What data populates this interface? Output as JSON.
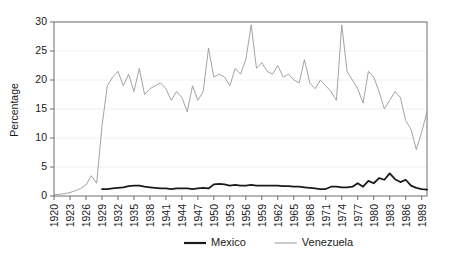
{
  "chart_data": {
    "type": "line",
    "title": "",
    "xlabel": "",
    "ylabel": "Percentage",
    "ylim": [
      0,
      30
    ],
    "xlim": [
      1920,
      1990
    ],
    "yticks": [
      0,
      5,
      10,
      15,
      20,
      25,
      30
    ],
    "ytick_labels": [
      "0",
      "5",
      "10",
      "15",
      "20",
      "25",
      "30"
    ],
    "xticks": [
      1920,
      1923,
      1926,
      1929,
      1932,
      1935,
      1938,
      1941,
      1944,
      1947,
      1950,
      1953,
      1956,
      1959,
      1962,
      1965,
      1968,
      1971,
      1974,
      1977,
      1980,
      1983,
      1986,
      1989
    ],
    "xtick_labels": [
      "1920",
      "1923",
      "1926",
      "1929",
      "1932",
      "1935",
      "1938",
      "1941",
      "1944",
      "1947",
      "1950",
      "1953",
      "1956",
      "1959",
      "1962",
      "1965",
      "1968",
      "1971",
      "1974",
      "1977",
      "1980",
      "1983",
      "1986",
      "1989"
    ],
    "grid": true,
    "legend_position": "below",
    "x": [
      1920,
      1921,
      1922,
      1923,
      1924,
      1925,
      1926,
      1927,
      1928,
      1929,
      1930,
      1931,
      1932,
      1933,
      1934,
      1935,
      1936,
      1937,
      1938,
      1939,
      1940,
      1941,
      1942,
      1943,
      1944,
      1945,
      1946,
      1947,
      1948,
      1949,
      1950,
      1951,
      1952,
      1953,
      1954,
      1955,
      1956,
      1957,
      1958,
      1959,
      1960,
      1961,
      1962,
      1963,
      1964,
      1965,
      1966,
      1967,
      1968,
      1969,
      1970,
      1971,
      1972,
      1973,
      1974,
      1975,
      1976,
      1977,
      1978,
      1979,
      1980,
      1981,
      1982,
      1983,
      1984,
      1985,
      1986,
      1987,
      1988,
      1989,
      1990
    ],
    "series": [
      {
        "name": "Mexico",
        "color": "#1a1a1a",
        "linewidth": 1.8,
        "values": [
          null,
          null,
          null,
          null,
          null,
          null,
          null,
          null,
          null,
          1.2,
          1.2,
          1.3,
          1.4,
          1.5,
          1.7,
          1.8,
          1.8,
          1.6,
          1.5,
          1.4,
          1.3,
          1.3,
          1.2,
          1.3,
          1.3,
          1.3,
          1.2,
          1.3,
          1.4,
          1.3,
          2.0,
          2.1,
          2.0,
          1.8,
          1.9,
          1.8,
          1.8,
          1.9,
          1.8,
          1.8,
          1.8,
          1.8,
          1.8,
          1.7,
          1.7,
          1.6,
          1.6,
          1.5,
          1.4,
          1.3,
          1.2,
          1.2,
          1.6,
          1.6,
          1.5,
          1.5,
          1.6,
          2.2,
          1.6,
          2.6,
          2.2,
          3.1,
          2.8,
          3.9,
          2.9,
          2.4,
          2.8,
          1.8,
          1.4,
          1.2,
          1.1
        ]
      },
      {
        "name": "Venezuela",
        "color": "#999999",
        "linewidth": 0.9,
        "values": [
          0.2,
          0.3,
          0.4,
          0.6,
          0.9,
          1.3,
          1.9,
          3.5,
          2.2,
          12.0,
          19.0,
          20.5,
          21.5,
          19.0,
          21.0,
          18.0,
          22.0,
          17.5,
          18.5,
          19.0,
          19.5,
          18.5,
          16.5,
          18.0,
          17.0,
          14.5,
          19.0,
          16.5,
          18.0,
          25.5,
          20.5,
          21.0,
          20.5,
          19.0,
          22.0,
          21.0,
          23.5,
          29.5,
          22.0,
          23.0,
          21.5,
          21.0,
          22.5,
          20.5,
          21.0,
          20.0,
          19.5,
          23.5,
          19.5,
          18.5,
          20.0,
          19.0,
          18.0,
          16.5,
          29.5,
          21.5,
          20.0,
          18.5,
          16.0,
          21.5,
          20.5,
          18.0,
          15.0,
          16.5,
          18.0,
          17.0,
          13.0,
          11.5,
          8.0,
          11.0,
          14.5
        ]
      }
    ]
  },
  "legend": {
    "items": [
      {
        "label": "Mexico",
        "color": "#1a1a1a",
        "linewidth": 2.2
      },
      {
        "label": "Venezuela",
        "color": "#999999",
        "linewidth": 1.0
      }
    ]
  }
}
